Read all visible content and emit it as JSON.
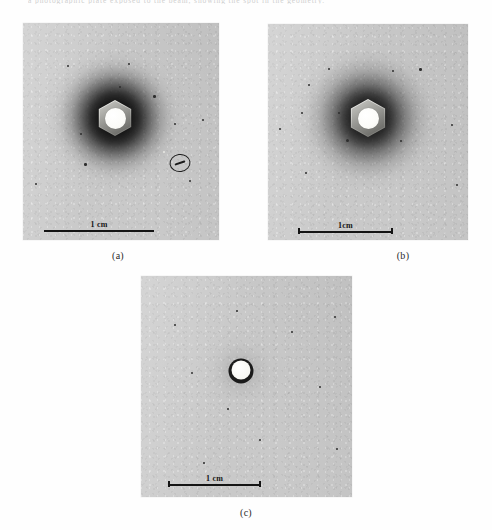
{
  "page": {
    "top_running_text": "a photographic plate exposed to the beam, showing the spot in the geometry.",
    "background_color": "#fefefe"
  },
  "figure": {
    "type": "photographic-plate-panels",
    "plate_color": "#c9c9c9",
    "ink_color": "#141414",
    "panels": [
      {
        "id": "a",
        "caption": "(a)",
        "scale_bar": {
          "label": "1 cm",
          "has_end_caps": false,
          "label_position": "above-left-of-centre"
        },
        "halo": "strong",
        "center_object": "hexagonal-nut",
        "annotation": {
          "type": "circled-track",
          "present": true
        }
      },
      {
        "id": "b",
        "caption": "(b)",
        "scale_bar": {
          "label": "1cm",
          "has_end_caps": true,
          "label_position": "above-centre"
        },
        "halo": "wide",
        "center_object": "hexagonal-nut",
        "annotation": {
          "type": "none",
          "present": false
        }
      },
      {
        "id": "c",
        "caption": "(c)",
        "scale_bar": {
          "label": "1 cm",
          "has_end_caps": true,
          "label_position": "above-centre"
        },
        "halo": "faint",
        "center_object": "small-disc",
        "annotation": {
          "type": "none",
          "present": false
        }
      }
    ]
  }
}
